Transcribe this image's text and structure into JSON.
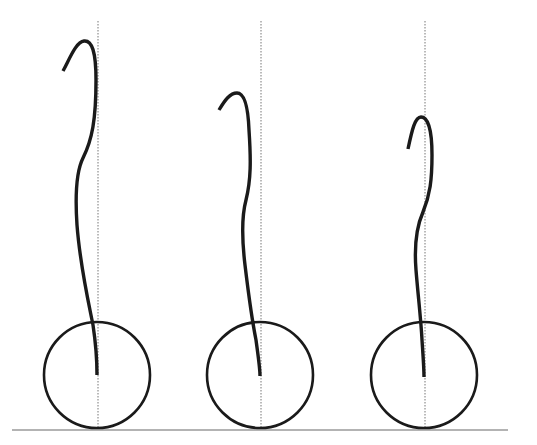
{
  "diagram": {
    "description": "Three figures, each a curved line (spine-like) rising from the center of a circle resting on a ground line, with a dotted vertical reference line through each circle center",
    "colors": {
      "background": "#ffffff",
      "stroke": "#1a1a1a",
      "reference_line": "#777777",
      "ground": "#9a9a9a"
    },
    "ground": {
      "x1": 12,
      "x2": 508,
      "y": 430
    },
    "figures": [
      {
        "id": "figure-1",
        "circle": {
          "cx": 97,
          "cy": 375,
          "r": 53
        },
        "reference_x": 98,
        "reference_top": 21,
        "curve": "M63,71 C70,58 76,42 84,41 C92,40 96,52 96,80 C96,120 92,140 83,158 C76,172 75,195 77,225 C80,265 88,300 93,325 C96,345 97,360 97,375"
      },
      {
        "id": "figure-2",
        "circle": {
          "cx": 260,
          "cy": 375,
          "r": 53
        },
        "reference_x": 261,
        "reference_top": 21,
        "curve": "M219,110 C225,100 230,93 237,93 C244,93 248,105 249,130 C251,160 251,180 246,200 C242,215 242,240 245,265 C248,290 252,320 256,340 C258,355 260,368 260,376"
      },
      {
        "id": "figure-3",
        "circle": {
          "cx": 424,
          "cy": 375,
          "r": 53
        },
        "reference_x": 425,
        "reference_top": 21,
        "curve": "M408,149 C412,130 415,117 421,117 C428,117 432,130 432,155 C432,180 430,195 423,212 C416,228 414,245 416,270 C418,295 421,320 422,340 C423,355 424,368 424,377"
      }
    ]
  }
}
